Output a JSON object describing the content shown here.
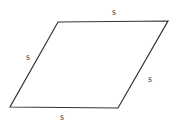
{
  "diagram": {
    "type": "rhombus",
    "stroke_color": "#333333",
    "background_color": "#ffffff",
    "vertices": {
      "top_left": [
        58,
        22
      ],
      "top_right": [
        168,
        21
      ],
      "bottom_right": [
        118,
        108
      ],
      "bottom_left": [
        10,
        107
      ]
    },
    "labels": {
      "top": "s",
      "left": "s",
      "right": "s",
      "bottom": "s"
    }
  }
}
